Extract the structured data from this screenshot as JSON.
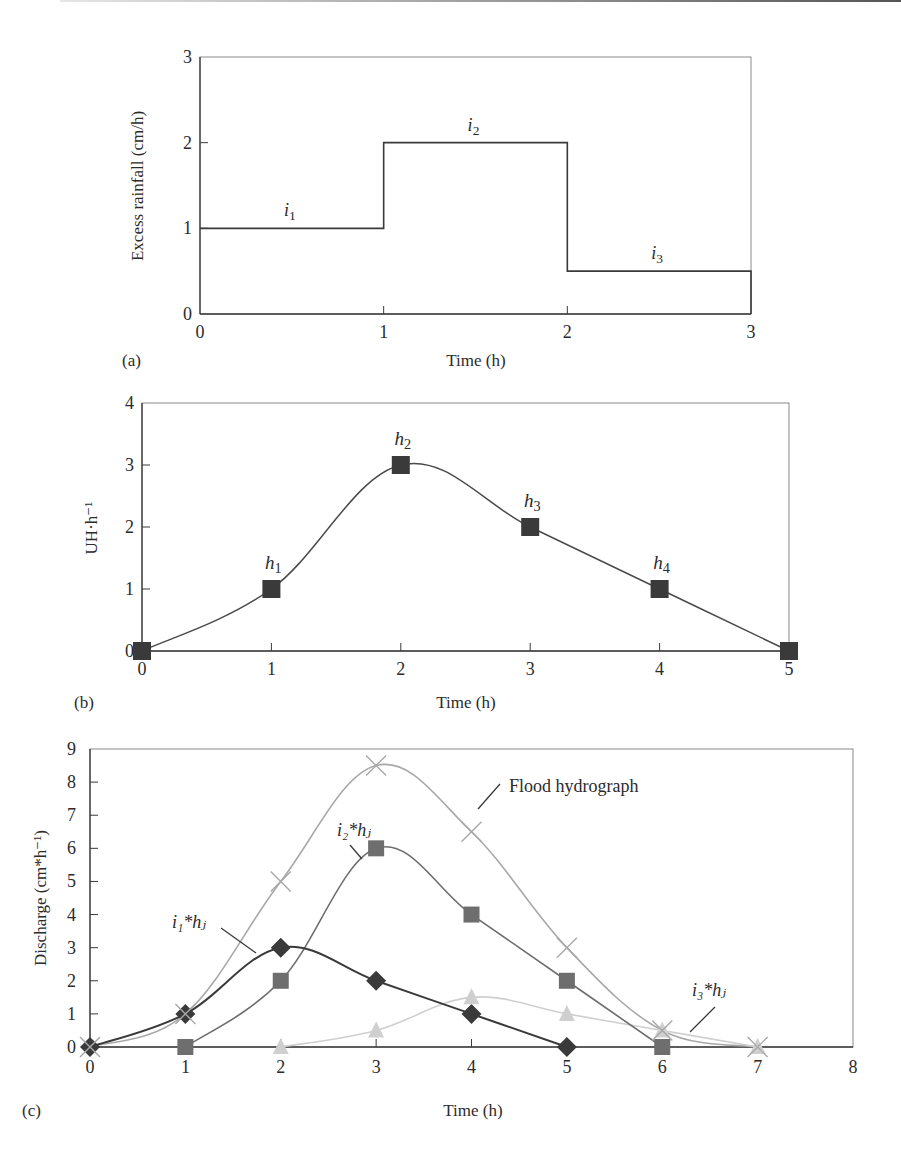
{
  "chart_data": [
    {
      "panel": "(a)",
      "type": "line",
      "subtype": "step",
      "title": "",
      "xlabel": "Time (h)",
      "ylabel": "Excess rainfall (cm/h)",
      "xlim": [
        0,
        3
      ],
      "ylim": [
        0,
        3
      ],
      "xticks": [
        "0",
        "1",
        "2",
        "3"
      ],
      "yticks": [
        "0",
        "1",
        "2",
        "3"
      ],
      "grid": false,
      "series": [
        {
          "name": "Excess rainfall",
          "x": [
            0,
            1,
            2,
            3
          ],
          "values": [
            1,
            2,
            0.5
          ],
          "color": "#3a3a3a"
        }
      ],
      "annotations": [
        {
          "text": "i",
          "sub": "1",
          "x": 0.5,
          "y": 1
        },
        {
          "text": "i",
          "sub": "2",
          "x": 1.5,
          "y": 2
        },
        {
          "text": "i",
          "sub": "3",
          "x": 2.5,
          "y": 0.5
        }
      ]
    },
    {
      "panel": "(b)",
      "type": "line",
      "title": "",
      "xlabel": "Time (h)",
      "ylabel": "UH·h⁻¹",
      "xlim": [
        0,
        5
      ],
      "ylim": [
        0,
        4
      ],
      "xticks": [
        "0",
        "1",
        "2",
        "3",
        "4",
        "5"
      ],
      "yticks": [
        "0",
        "1",
        "2",
        "3",
        "4"
      ],
      "grid": false,
      "series": [
        {
          "name": "Unit hydrograph",
          "x": [
            0,
            1,
            2,
            3,
            4,
            5
          ],
          "values": [
            0,
            1,
            3,
            2,
            1,
            0
          ],
          "marker": "square",
          "color": "#3a3a3a"
        }
      ],
      "annotations": [
        {
          "text": "h",
          "sub": "1",
          "x": 1,
          "y": 1
        },
        {
          "text": "h",
          "sub": "2",
          "x": 2,
          "y": 3
        },
        {
          "text": "h",
          "sub": "3",
          "x": 3,
          "y": 2
        },
        {
          "text": "h",
          "sub": "4",
          "x": 4,
          "y": 1
        }
      ]
    },
    {
      "panel": "(c)",
      "type": "line",
      "title": "",
      "xlabel": "Time (h)",
      "ylabel": "Discharge (cm*h⁻¹)",
      "xlim": [
        0,
        8
      ],
      "ylim": [
        0,
        9
      ],
      "xticks": [
        "0",
        "1",
        "2",
        "3",
        "4",
        "5",
        "6",
        "7",
        "8"
      ],
      "yticks": [
        "0",
        "1",
        "2",
        "3",
        "4",
        "5",
        "6",
        "7",
        "8",
        "9"
      ],
      "grid": false,
      "x": [
        0,
        1,
        2,
        3,
        4,
        5,
        6,
        7
      ],
      "series": [
        {
          "name": "Flood hydrograph",
          "x": [
            0,
            1,
            2,
            3,
            4,
            5,
            6,
            7
          ],
          "values": [
            0,
            1,
            5,
            8.5,
            6.5,
            3,
            0.5,
            0
          ],
          "marker": "x",
          "color": "#a8a8a8"
        },
        {
          "name": "i1*hj",
          "x": [
            0,
            1,
            2,
            3,
            4,
            5
          ],
          "values": [
            0,
            1,
            3,
            2,
            1,
            0
          ],
          "marker": "diamond",
          "color": "#3a3a3a"
        },
        {
          "name": "i2*hj",
          "x": [
            1,
            2,
            3,
            4,
            5,
            6
          ],
          "values": [
            0,
            2,
            6,
            4,
            2,
            0
          ],
          "marker": "square",
          "color": "#6e6e6e"
        },
        {
          "name": "i3*hj",
          "x": [
            2,
            3,
            4,
            5,
            6,
            7
          ],
          "values": [
            0,
            0.5,
            1.5,
            1,
            0.5,
            0
          ],
          "marker": "triangle",
          "color": "#cfcfcf"
        }
      ],
      "annotations": [
        {
          "text": "Flood hydrograph",
          "x": 4.7,
          "y": 8.2
        },
        {
          "text": "i₂*hⱼ",
          "x": 2.6,
          "y": 6.8
        },
        {
          "text": "i₁*hⱼ",
          "x": 1.1,
          "y": 3.7
        },
        {
          "text": "i₃*hⱼ",
          "x": 6.4,
          "y": 1.6
        }
      ]
    }
  ],
  "labels": {
    "panel_a": "(a)",
    "panel_b": "(b)",
    "panel_c": "(c)",
    "xlabel_a": "Time (h)",
    "xlabel_b": "Time (h)",
    "xlabel_c": "Time (h)",
    "ylabel_a": "Excess rainfall (cm/h)",
    "ylabel_b": "UH·h⁻¹",
    "ylabel_c": "Discharge (cm*h⁻¹)",
    "flood": "Flood hydrograph"
  }
}
